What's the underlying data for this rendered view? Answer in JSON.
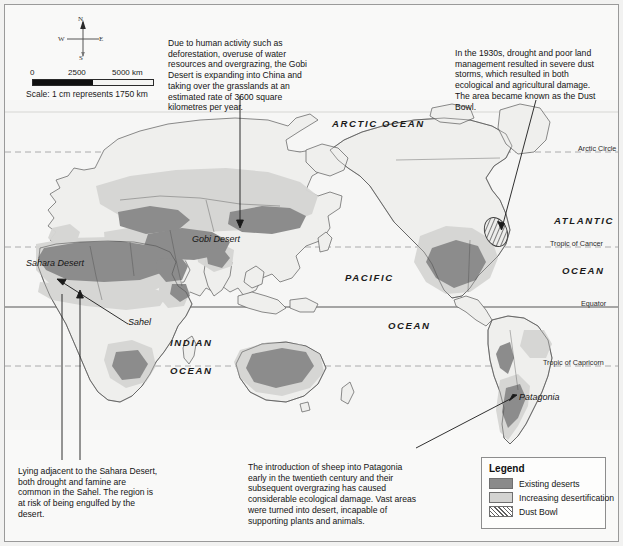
{
  "map": {
    "title": "World map of desertification",
    "compass": {
      "north": "N",
      "south": "S",
      "east": "E",
      "west": "W"
    },
    "scale": {
      "tick_0": "0",
      "tick_1": "2500",
      "tick_2": "5000 km",
      "caption": "Scale: 1 cm represents 1750 km"
    },
    "annotations": [
      {
        "id": "gobi",
        "text": "Due to human activity such as deforestation, overuse of water resources and overgrazing, the Gobi Desert is expanding into China and taking over the grasslands at an estimated rate of 3600 square kilometres per year."
      },
      {
        "id": "dust-bowl",
        "text": "In the 1930s, drought and poor land management resulted in severe dust storms, which resulted in both ecological and agricultural damage. The area became known as the Dust Bowl."
      },
      {
        "id": "sahel",
        "text": "Lying adjacent to the Sahara Desert, both drought and famine are common in the Sahel. The region is at risk of being engulfed by the desert."
      },
      {
        "id": "patagonia",
        "text": "The introduction of sheep into Patagonia early in the twentieth century and their subsequent overgrazing has caused considerable ecological damage. Vast areas were turned into desert, incapable of supporting plants and animals."
      }
    ],
    "ocean_labels": [
      {
        "id": "arctic-ocean",
        "text": "ARCTIC OCEAN"
      },
      {
        "id": "atlantic",
        "text": "ATLANTIC"
      },
      {
        "id": "atlantic-ocean",
        "text": "OCEAN"
      },
      {
        "id": "pacific",
        "text": "PACIFIC"
      },
      {
        "id": "pacific-ocean",
        "text": "OCEAN"
      },
      {
        "id": "indian",
        "text": "INDIAN"
      },
      {
        "id": "indian-ocean",
        "text": "OCEAN"
      }
    ],
    "region_labels": [
      {
        "id": "gobi-desert",
        "text": "Gobi Desert"
      },
      {
        "id": "sahara-desert",
        "text": "Sahara Desert"
      },
      {
        "id": "sahel",
        "text": "Sahel"
      },
      {
        "id": "patagonia",
        "text": "Patagonia"
      }
    ],
    "latitude_labels": [
      {
        "id": "arctic-circle",
        "text": "Arctic Circle"
      },
      {
        "id": "tropic-of-cancer",
        "text": "Tropic of Cancer"
      },
      {
        "id": "equator",
        "text": "Equator"
      },
      {
        "id": "tropic-of-capricorn",
        "text": "Tropic of Capricorn"
      }
    ]
  },
  "legend": {
    "title": "Legend",
    "items": [
      {
        "id": "existing-deserts",
        "label": "Existing deserts",
        "color": "#8a8a8a",
        "pattern": "solid"
      },
      {
        "id": "increasing-desertification",
        "label": "Increasing desertification",
        "color": "#d3d3d1",
        "pattern": "solid"
      },
      {
        "id": "dust-bowl",
        "label": "Dust Bowl",
        "color": "#5f5f5f",
        "pattern": "diagonal-hatch"
      }
    ]
  },
  "colors": {
    "page_background": "#f2f2f1",
    "map_background": "#fbfbfa",
    "ocean": "#f7f7f6",
    "land": "#eeeeec",
    "existing_desert": "#8a8a8a",
    "increasing_desertification": "#d3d3d1",
    "coastline": "#555555",
    "border_line": "#9a9a9a",
    "graticule": "#9b9b9b",
    "text": "#141414"
  }
}
